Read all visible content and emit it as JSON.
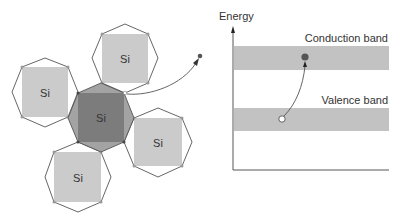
{
  "lattice": {
    "atom_label": "Si",
    "atoms": [
      {
        "id": "top",
        "label": "Si",
        "cx": 125,
        "cy": 58
      },
      {
        "id": "left",
        "label": "Si",
        "cx": 45,
        "cy": 92
      },
      {
        "id": "center",
        "label": "Si",
        "cx": 101,
        "cy": 118
      },
      {
        "id": "right",
        "label": "Si",
        "cx": 158,
        "cy": 142
      },
      {
        "id": "bottom",
        "label": "Si",
        "cx": 78,
        "cy": 177
      }
    ]
  },
  "band_diagram": {
    "axis_label": "Energy",
    "conduction_band_label": "Conduction band",
    "valence_band_label": "Valence band"
  },
  "colors": {
    "outline": "#555555",
    "light_square": "#cbcbcb",
    "center_ring": "#a3a3a3",
    "center_square": "#7c7c7c",
    "band": "#c2c2c2",
    "electron": "#555555",
    "hole": "#ffffff",
    "vertex_dot": "#9a9a9a"
  }
}
